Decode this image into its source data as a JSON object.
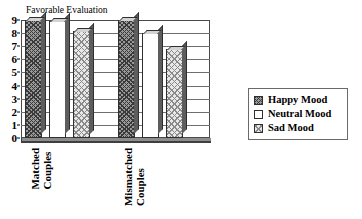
{
  "chart_data": {
    "type": "bar",
    "title": "Favorable Evaluation",
    "xlabel": "",
    "ylabel": "Favorable Evaluation",
    "ylim": [
      0,
      9
    ],
    "yticks": [
      0,
      1,
      2,
      3,
      4,
      5,
      6,
      7,
      8,
      9
    ],
    "grid": true,
    "legend_position": "right",
    "style": "3d-clustered-column",
    "categories": [
      "Matched Couples",
      "Mismatched Couples"
    ],
    "category_lines": [
      [
        "Matched",
        "Couples"
      ],
      [
        "Mismatched",
        "Couples"
      ]
    ],
    "series": [
      {
        "name": "Happy Mood",
        "values": [
          9.0,
          9.0
        ],
        "pattern": "dark-crosshatch"
      },
      {
        "name": "Neutral Mood",
        "values": [
          8.9,
          8.0
        ],
        "pattern": "white-empty"
      },
      {
        "name": "Sad Mood",
        "values": [
          8.2,
          6.8
        ],
        "pattern": "light-dotted"
      }
    ]
  },
  "legend": {
    "items": [
      {
        "label": "Happy Mood",
        "pattern": "dark-crosshatch"
      },
      {
        "label": "Neutral Mood",
        "pattern": "white-empty"
      },
      {
        "label": "Sad Mood",
        "pattern": "light-dotted"
      }
    ]
  }
}
